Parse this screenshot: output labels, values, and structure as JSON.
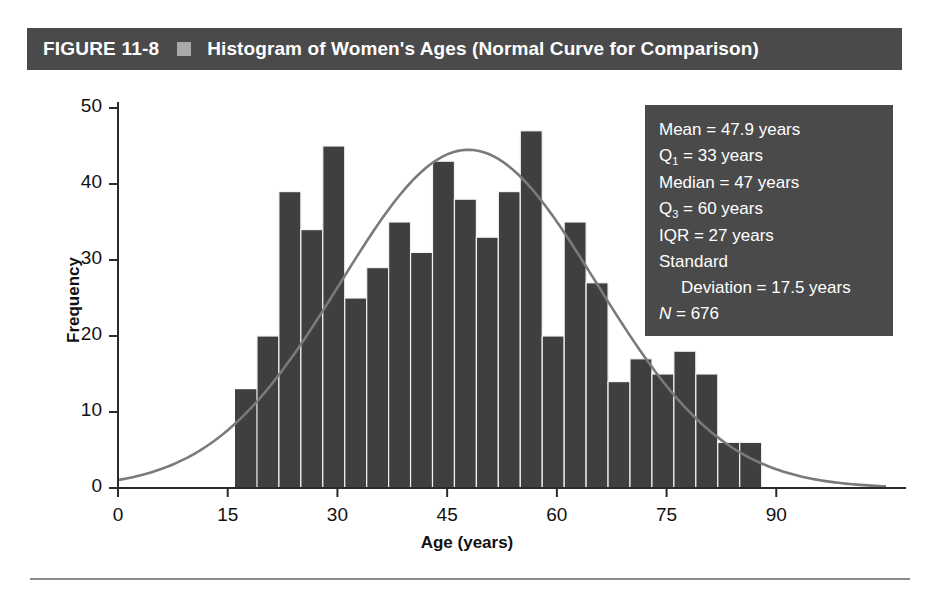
{
  "figure": {
    "label": "FIGURE 11-8",
    "title": "Histogram of Women's Ages (Normal Curve for Comparison)",
    "separator_icon": "gray-square-icon",
    "header_bg": "#4a4a4a",
    "header_text_color": "#ffffff"
  },
  "stats_box": {
    "bg": "#4a4a4a",
    "text_color": "#ffffff",
    "lines": [
      {
        "id": "mean",
        "label": "Mean",
        "sub": "",
        "text": "Mean = 47.9 years"
      },
      {
        "id": "q1",
        "label": "Q",
        "sub": "1",
        "text": " = 33 years"
      },
      {
        "id": "median",
        "label": "Median",
        "sub": "",
        "text": "Median = 47 years"
      },
      {
        "id": "q3",
        "label": "Q",
        "sub": "3",
        "text": " = 60 years"
      },
      {
        "id": "iqr",
        "label": "IQR",
        "sub": "",
        "text": "IQR = 27 years"
      },
      {
        "id": "standard",
        "label": "Standard",
        "sub": "",
        "text": "Standard"
      },
      {
        "id": "deviation",
        "label": "Deviation",
        "sub": "",
        "text": "Deviation = 17.5 years"
      },
      {
        "id": "n",
        "label": "N",
        "sub": "",
        "text": " = 676"
      }
    ],
    "mean": "Mean = 47.9 years",
    "q1_value": " = 33 years",
    "median": "Median = 47 years",
    "q3_value": " = 60 years",
    "iqr": "IQR = 27 years",
    "standard": "Standard",
    "deviation": "Deviation = 17.5 years",
    "n_value": " = 676",
    "n_symbol": "N",
    "q_symbol": "Q",
    "q1_sub": "1",
    "q3_sub": "3"
  },
  "chart_data": {
    "type": "bar",
    "title": "Histogram of Women's Ages (Normal Curve for Comparison)",
    "xlabel": "Age (years)",
    "ylabel": "Frequency",
    "xlim": [
      0,
      105
    ],
    "ylim": [
      0,
      50
    ],
    "grid": false,
    "legend": "none",
    "bar_color": "#3f3f3f",
    "curve_color": "#7a7a7a",
    "bin_width": 3,
    "x_ticks": [
      0,
      15,
      30,
      45,
      60,
      75,
      90
    ],
    "x_tick_labels": [
      "0",
      "15",
      "30",
      "45",
      "60",
      "75",
      "90"
    ],
    "y_ticks": [
      0,
      10,
      20,
      30,
      40,
      50
    ],
    "y_tick_labels": [
      "0",
      "10",
      "20",
      "30",
      "40",
      "50"
    ],
    "bin_starts": [
      16,
      19,
      22,
      25,
      28,
      31,
      34,
      37,
      40,
      43,
      46,
      49,
      52,
      55,
      58,
      61,
      64,
      67,
      70,
      73,
      76,
      79,
      82,
      85
    ],
    "categories": [
      "16-19",
      "19-22",
      "22-25",
      "25-28",
      "28-31",
      "31-34",
      "34-37",
      "37-40",
      "40-43",
      "43-46",
      "46-49",
      "49-52",
      "52-55",
      "55-58",
      "58-61",
      "61-64",
      "64-67",
      "67-70",
      "70-73",
      "73-76",
      "76-79",
      "79-82",
      "82-85",
      "85-88"
    ],
    "values": [
      13,
      20,
      39,
      34,
      45,
      25,
      29,
      35,
      31,
      43,
      38,
      33,
      39,
      47,
      20,
      35,
      27,
      14,
      17,
      15,
      18,
      15,
      6,
      6
    ],
    "overlay_curve": {
      "name": "Normal curve",
      "distribution": "normal",
      "mean": 47.9,
      "sd": 17.5,
      "n": 676,
      "peak_value": 44.5,
      "peak_x": 47.9
    },
    "annotations": {
      "mean": 47.9,
      "q1": 33,
      "median": 47,
      "q3": 60,
      "iqr": 27,
      "sd": 17.5,
      "n": 676
    }
  }
}
